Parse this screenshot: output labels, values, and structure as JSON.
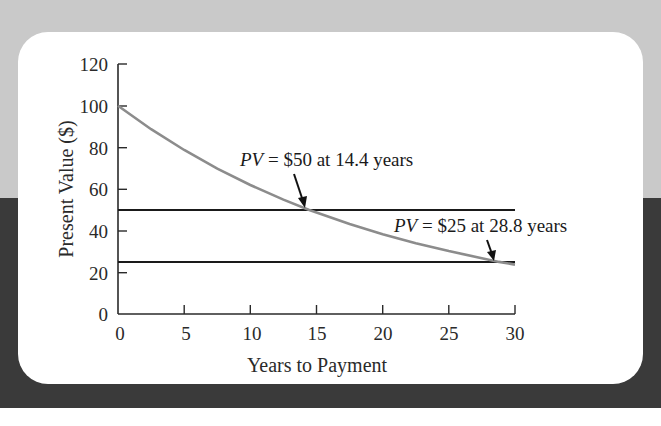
{
  "chart_data": {
    "type": "line",
    "title": "",
    "xlabel": "Years to Payment",
    "ylabel": "Present Value ($)",
    "xlim": [
      0,
      30
    ],
    "ylim": [
      0,
      120
    ],
    "x_ticks": [
      0,
      5,
      10,
      15,
      20,
      25,
      30
    ],
    "y_ticks": [
      0,
      20,
      40,
      60,
      80,
      100,
      120
    ],
    "grid": false,
    "series": [
      {
        "name": "Present value of $100",
        "color": "#8c8c8c",
        "x": [
          0,
          2.5,
          5,
          7.5,
          10,
          12.5,
          14.4,
          15,
          17.5,
          20,
          22.5,
          25,
          27.5,
          28.8,
          30
        ],
        "values": [
          100,
          88.7,
          78.7,
          69.8,
          61.9,
          54.9,
          50,
          48.7,
          43.2,
          38.3,
          34.0,
          30.2,
          26.8,
          25,
          23.7
        ]
      }
    ],
    "reference_lines": [
      {
        "y": 50,
        "x_range": [
          0,
          30
        ],
        "color": "#1a1a1a"
      },
      {
        "y": 25,
        "x_range": [
          0,
          30
        ],
        "color": "#1a1a1a"
      }
    ],
    "annotations": [
      {
        "pv_label": "PV",
        "text": " = $50 at 14.4 years",
        "x": 14.4,
        "y": 50
      },
      {
        "pv_label": "PV",
        "text": " = $25 at 28.8 years",
        "x": 28.8,
        "y": 25
      }
    ]
  },
  "labels": {
    "x_title": "Years to Payment",
    "y_title": "Present Value ($)",
    "x_ticks": [
      "0",
      "5",
      "10",
      "15",
      "20",
      "25",
      "30"
    ],
    "y_ticks": [
      "0",
      "20",
      "40",
      "60",
      "80",
      "100",
      "120"
    ],
    "annot1_pv": "PV",
    "annot1_rest": " = $50 at 14.4 years",
    "annot2_pv": "PV",
    "annot2_rest": " = $25 at 28.8 years"
  },
  "colors": {
    "background_top": "#c9c9c9",
    "background_bottom": "#3a3a3a",
    "card": "#ffffff",
    "curve": "#8c8c8c",
    "reference_line": "#1a1a1a",
    "axis": "#2a2a2a"
  }
}
